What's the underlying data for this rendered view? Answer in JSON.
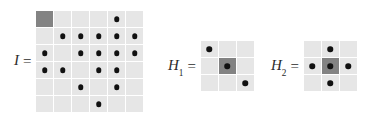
{
  "figure": {
    "background_color": "#ffffff",
    "cell_color": "#e6e6e6",
    "highlight_cell_color": "#838383",
    "dot_color": "#111111",
    "equals_sign": "="
  },
  "matrices": [
    {
      "id": "I",
      "name": "image-matrix",
      "label_base": "I",
      "label_sub": "",
      "rows": 6,
      "cols": 6,
      "cells": [
        [
          {
            "dot": false,
            "highlight": true
          },
          {
            "dot": false,
            "highlight": false
          },
          {
            "dot": false,
            "highlight": false
          },
          {
            "dot": false,
            "highlight": false
          },
          {
            "dot": true,
            "highlight": false
          },
          {
            "dot": false,
            "highlight": false
          }
        ],
        [
          {
            "dot": false,
            "highlight": false
          },
          {
            "dot": true,
            "highlight": false
          },
          {
            "dot": true,
            "highlight": false
          },
          {
            "dot": true,
            "highlight": false
          },
          {
            "dot": true,
            "highlight": false
          },
          {
            "dot": true,
            "highlight": false
          }
        ],
        [
          {
            "dot": true,
            "highlight": false
          },
          {
            "dot": false,
            "highlight": false
          },
          {
            "dot": true,
            "highlight": false
          },
          {
            "dot": true,
            "highlight": false
          },
          {
            "dot": true,
            "highlight": false
          },
          {
            "dot": true,
            "highlight": false
          }
        ],
        [
          {
            "dot": true,
            "highlight": false
          },
          {
            "dot": true,
            "highlight": false
          },
          {
            "dot": false,
            "highlight": false
          },
          {
            "dot": true,
            "highlight": false
          },
          {
            "dot": true,
            "highlight": false
          },
          {
            "dot": false,
            "highlight": false
          }
        ],
        [
          {
            "dot": false,
            "highlight": false
          },
          {
            "dot": false,
            "highlight": false
          },
          {
            "dot": true,
            "highlight": false
          },
          {
            "dot": false,
            "highlight": false
          },
          {
            "dot": true,
            "highlight": false
          },
          {
            "dot": false,
            "highlight": false
          }
        ],
        [
          {
            "dot": false,
            "highlight": false
          },
          {
            "dot": false,
            "highlight": false
          },
          {
            "dot": false,
            "highlight": false
          },
          {
            "dot": true,
            "highlight": false
          },
          {
            "dot": false,
            "highlight": false
          },
          {
            "dot": false,
            "highlight": false
          }
        ]
      ]
    },
    {
      "id": "H1",
      "name": "kernel-h1",
      "label_base": "H",
      "label_sub": "1",
      "rows": 3,
      "cols": 3,
      "cells": [
        [
          {
            "dot": true,
            "highlight": false
          },
          {
            "dot": false,
            "highlight": false
          },
          {
            "dot": false,
            "highlight": false
          }
        ],
        [
          {
            "dot": false,
            "highlight": false
          },
          {
            "dot": true,
            "highlight": true
          },
          {
            "dot": false,
            "highlight": false
          }
        ],
        [
          {
            "dot": false,
            "highlight": false
          },
          {
            "dot": false,
            "highlight": false
          },
          {
            "dot": true,
            "highlight": false
          }
        ]
      ]
    },
    {
      "id": "H2",
      "name": "kernel-h2",
      "label_base": "H",
      "label_sub": "2",
      "rows": 3,
      "cols": 3,
      "cells": [
        [
          {
            "dot": false,
            "highlight": false
          },
          {
            "dot": true,
            "highlight": false
          },
          {
            "dot": false,
            "highlight": false
          }
        ],
        [
          {
            "dot": true,
            "highlight": false
          },
          {
            "dot": true,
            "highlight": true
          },
          {
            "dot": true,
            "highlight": false
          }
        ],
        [
          {
            "dot": false,
            "highlight": false
          },
          {
            "dot": true,
            "highlight": false
          },
          {
            "dot": false,
            "highlight": false
          }
        ]
      ]
    }
  ]
}
